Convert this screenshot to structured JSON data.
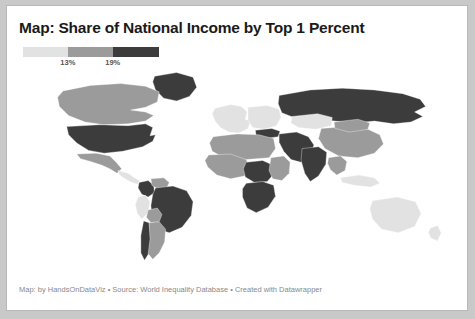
{
  "card": {
    "background": "#ffffff",
    "border_color": "#b8b8b8",
    "page_background": "#c9c9c9"
  },
  "title": "Map: Share of National Income by Top 1 Percent",
  "footer": "Map: by HandsOnDataViz • Source: World Inequality Database • Created with Datawrapper",
  "legend": {
    "ticks": [
      {
        "label": "13%",
        "x_pct": 33
      },
      {
        "label": "19%",
        "x_pct": 66
      }
    ],
    "bands": [
      {
        "color": "#e2e2e2",
        "start_pct": 0,
        "end_pct": 33
      },
      {
        "color": "#9b9b9b",
        "start_pct": 33,
        "end_pct": 66
      },
      {
        "color": "#3c3c3c",
        "start_pct": 66,
        "end_pct": 100
      }
    ]
  },
  "chart_data": {
    "type": "map",
    "title": "Map: Share of National Income by Top 1 Percent",
    "subtitle": "",
    "xlabel": "",
    "ylabel": "",
    "value_unit": "percent",
    "legend_position": "top-left",
    "grid": false,
    "projection": "equirectangular-like",
    "class_breaks": [
      13,
      19
    ],
    "class_colors": [
      "#e2e2e2",
      "#9b9b9b",
      "#3c3c3c"
    ],
    "class_labels": [
      "under 13%",
      "13% to 19%",
      "over 19%"
    ],
    "no_data_color": "#f4f4f4",
    "regions": [
      {
        "name": "Greenland",
        "class": 2,
        "color": "#3c3c3c"
      },
      {
        "name": "Canada",
        "class": 1,
        "color": "#9b9b9b"
      },
      {
        "name": "United States",
        "class": 2,
        "color": "#3c3c3c"
      },
      {
        "name": "Mexico",
        "class": 1,
        "color": "#9b9b9b"
      },
      {
        "name": "Central America",
        "class": 0,
        "color": "#e2e2e2"
      },
      {
        "name": "Colombia",
        "class": 2,
        "color": "#3c3c3c"
      },
      {
        "name": "Venezuela",
        "class": 1,
        "color": "#9b9b9b"
      },
      {
        "name": "Peru",
        "class": 0,
        "color": "#e2e2e2"
      },
      {
        "name": "Brazil",
        "class": 2,
        "color": "#3c3c3c"
      },
      {
        "name": "Bolivia",
        "class": 1,
        "color": "#9b9b9b"
      },
      {
        "name": "Chile",
        "class": 2,
        "color": "#3c3c3c"
      },
      {
        "name": "Argentina",
        "class": 1,
        "color": "#9b9b9b"
      },
      {
        "name": "Western Europe",
        "class": 0,
        "color": "#e2e2e2"
      },
      {
        "name": "Eastern Europe",
        "class": 0,
        "color": "#e2e2e2"
      },
      {
        "name": "Russia",
        "class": 2,
        "color": "#3c3c3c"
      },
      {
        "name": "Turkey",
        "class": 2,
        "color": "#3c3c3c"
      },
      {
        "name": "Middle East",
        "class": 2,
        "color": "#3c3c3c"
      },
      {
        "name": "North Africa",
        "class": 1,
        "color": "#9b9b9b"
      },
      {
        "name": "West Africa",
        "class": 1,
        "color": "#9b9b9b"
      },
      {
        "name": "Central Africa",
        "class": 2,
        "color": "#3c3c3c"
      },
      {
        "name": "East Africa",
        "class": 1,
        "color": "#9b9b9b"
      },
      {
        "name": "Southern Africa",
        "class": 2,
        "color": "#3c3c3c"
      },
      {
        "name": "Kazakhstan",
        "class": 0,
        "color": "#e2e2e2"
      },
      {
        "name": "China",
        "class": 1,
        "color": "#9b9b9b"
      },
      {
        "name": "Mongolia",
        "class": 1,
        "color": "#9b9b9b"
      },
      {
        "name": "India",
        "class": 2,
        "color": "#3c3c3c"
      },
      {
        "name": "Southeast Asia",
        "class": 1,
        "color": "#9b9b9b"
      },
      {
        "name": "Indonesia",
        "class": 0,
        "color": "#e2e2e2"
      },
      {
        "name": "Australia",
        "class": 0,
        "color": "#e2e2e2"
      },
      {
        "name": "New Zealand",
        "class": 0,
        "color": "#e2e2e2"
      }
    ]
  }
}
